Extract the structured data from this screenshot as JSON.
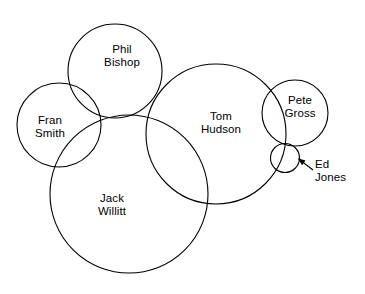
{
  "diagram": {
    "type": "venn-euler",
    "title": "",
    "canvas": {
      "width": 365,
      "height": 294,
      "background": "#ffffff"
    },
    "stroke_color": "#000000",
    "text_color": "#000000",
    "sets": [
      {
        "id": "fran-smith",
        "label": "Fran\nSmith",
        "name_line1": "Fran",
        "name_line2": "Smith",
        "cx": 59,
        "cy": 125,
        "r": 42
      },
      {
        "id": "phil-bishop",
        "label": "Phil\nBishop",
        "name_line1": "Phil",
        "name_line2": "Bishop",
        "cx": 115,
        "cy": 71,
        "r": 47
      },
      {
        "id": "jack-willitt",
        "label": "Jack\nWillitt",
        "name_line1": "Jack",
        "name_line2": "Willitt",
        "cx": 129,
        "cy": 194,
        "r": 79
      },
      {
        "id": "tom-hudson",
        "label": "Tom\nHudson",
        "name_line1": "Tom",
        "name_line2": "Hudson",
        "cx": 216,
        "cy": 134,
        "r": 70
      },
      {
        "id": "pete-gross",
        "label": "Pete\nGross",
        "name_line1": "Pete",
        "name_line2": "Gross",
        "cx": 295,
        "cy": 113,
        "r": 33
      },
      {
        "id": "ed-jones",
        "label": "Ed\nJones",
        "name_line1": "Ed",
        "name_line2": "Jones",
        "cx": 285,
        "cy": 158,
        "r": 14.5
      }
    ],
    "annotations": [
      {
        "id": "ed-jones-leader",
        "for": "ed-jones",
        "label": "Ed\nJones",
        "arrow_from_x": 312,
        "arrow_from_y": 170,
        "arrow_to_x": 297,
        "arrow_to_y": 159
      }
    ]
  }
}
